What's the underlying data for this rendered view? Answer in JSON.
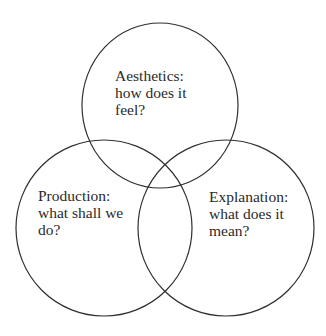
{
  "diagram": {
    "type": "venn",
    "stroke_color": "#2f2f2f",
    "background": "#ffffff",
    "circles": [
      {
        "id": "aesthetics",
        "lines": [
          "Aesthetics:",
          "how does it",
          "feel?"
        ]
      },
      {
        "id": "production",
        "lines": [
          "Production:",
          "what shall we",
          "do?"
        ]
      },
      {
        "id": "explanation",
        "lines": [
          "Explanation:",
          "what does it",
          "mean?"
        ]
      }
    ]
  }
}
